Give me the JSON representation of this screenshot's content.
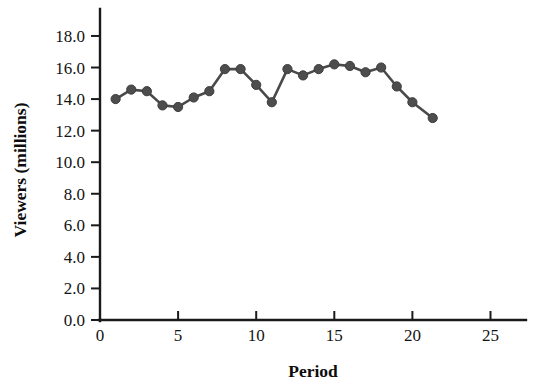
{
  "chart_data": {
    "type": "line",
    "title": "",
    "xlabel": "Period",
    "ylabel": "Viewers (millions)",
    "xlim": [
      0,
      26.5
    ],
    "ylim": [
      0,
      19.5
    ],
    "xticks": [
      0,
      5,
      10,
      15,
      20,
      25
    ],
    "xtick_labels": [
      "0",
      "5",
      "10",
      "15",
      "20",
      "25"
    ],
    "yticks": [
      0.0,
      2.0,
      4.0,
      6.0,
      8.0,
      10.0,
      12.0,
      14.0,
      16.0,
      18.0
    ],
    "ytick_labels": [
      "0.0",
      "2.0",
      "4.0",
      "6.0",
      "8.0",
      "10.0",
      "12.0",
      "14.0",
      "16.0",
      "18.0"
    ],
    "grid": false,
    "legend": false,
    "legend_position": "none",
    "marker": "circle",
    "marker_color": "#4d4d4d",
    "line_color": "#4a4a4a",
    "x": [
      1,
      2,
      3,
      4,
      5,
      6,
      7,
      8,
      9,
      10,
      11,
      12,
      13,
      14,
      15,
      16,
      17,
      18,
      19,
      20,
      21.3
    ],
    "values": [
      14.0,
      14.6,
      14.5,
      13.6,
      13.5,
      14.1,
      14.5,
      15.9,
      15.9,
      14.9,
      13.8,
      15.9,
      15.5,
      15.9,
      16.2,
      16.1,
      15.7,
      16.0,
      14.8,
      13.8,
      12.8
    ],
    "series": [
      {
        "name": "Viewers",
        "values": [
          14.0,
          14.6,
          14.5,
          13.6,
          13.5,
          14.1,
          14.5,
          15.9,
          15.9,
          14.9,
          13.8,
          15.9,
          15.5,
          15.9,
          16.2,
          16.1,
          15.7,
          16.0,
          14.8,
          13.8,
          12.8
        ]
      }
    ]
  }
}
